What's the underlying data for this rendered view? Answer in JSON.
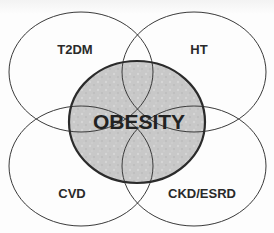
{
  "diagram": {
    "type": "venn",
    "center": {
      "label": "OBESITY",
      "fill": "#c9c9c9",
      "stroke": "#2b2b2b"
    },
    "sets": [
      {
        "id": "t2dm",
        "label": "T2DM",
        "position": "top-left"
      },
      {
        "id": "ht",
        "label": "HT",
        "position": "top-right"
      },
      {
        "id": "cvd",
        "label": "CVD",
        "position": "bottom-left"
      },
      {
        "id": "ckd",
        "label": "CKD/ESRD",
        "position": "bottom-right"
      }
    ],
    "colors": {
      "outline": "#3a3a3a",
      "background": "#fdfdfd",
      "text": "#2a2a2a"
    }
  }
}
